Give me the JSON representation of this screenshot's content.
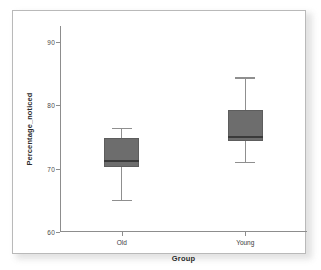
{
  "chart_data": {
    "type": "box",
    "title": "",
    "xlabel": "Group",
    "ylabel": "Percentage_noticed",
    "categories": [
      "Old",
      "Young"
    ],
    "ylim": [
      60,
      92.5
    ],
    "yticks": [
      60,
      70,
      80,
      90
    ],
    "ytick_labels": [
      "60",
      "70",
      "80",
      "90"
    ],
    "grid": false,
    "legend": false,
    "box_color": "#6d6d6d",
    "median_color": "#3a3a3a",
    "whisker_color": "#8f8f8f",
    "axis_color": "#8d8d8d",
    "boxes": [
      {
        "category": "Old",
        "whisker_low": 65.0,
        "q1": 70.3,
        "median": 71.3,
        "q3": 74.8,
        "whisker_high": 76.4
      },
      {
        "category": "Young",
        "whisker_low": 71.1,
        "q1": 74.3,
        "median": 75.1,
        "q3": 79.2,
        "whisker_high": 84.4
      }
    ]
  }
}
